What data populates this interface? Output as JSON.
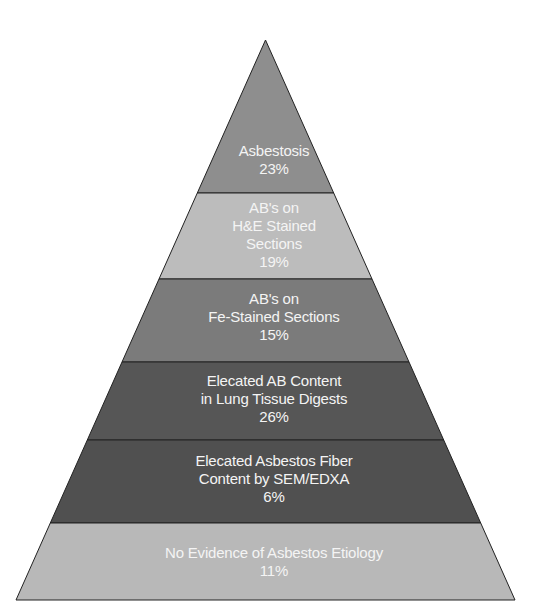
{
  "diagram": {
    "type": "pyramid",
    "levels": [
      {
        "lines": [
          "Asbestosis"
        ],
        "percent": "23%",
        "color": "#8e8e8e"
      },
      {
        "lines": [
          "AB's on",
          "H&E Stained",
          "Sections"
        ],
        "percent": "19%",
        "color": "#bcbcbc"
      },
      {
        "lines": [
          "AB's on",
          "Fe-Stained Sections"
        ],
        "percent": "15%",
        "color": "#7b7b7b"
      },
      {
        "lines": [
          "Elecated AB Content",
          "in Lung Tissue Digests"
        ],
        "percent": "26%",
        "color": "#565656"
      },
      {
        "lines": [
          "Elecated Asbestos Fiber",
          "Content by SEM/EDXA"
        ],
        "percent": "6%",
        "color": "#505050"
      },
      {
        "lines": [
          "No Evidence of Asbestos Etiology"
        ],
        "percent": "11%",
        "color": "#b8b8b8"
      }
    ]
  }
}
